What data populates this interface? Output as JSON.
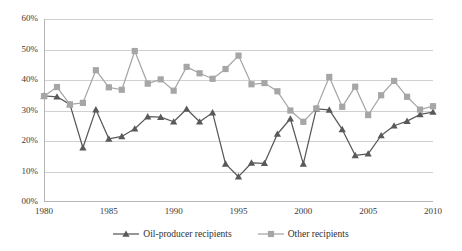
{
  "chart_data": {
    "type": "line",
    "title": "",
    "subtitle": "",
    "xlabel": "",
    "ylabel": "",
    "xlim": [
      1980,
      2010
    ],
    "ylim": [
      0,
      60
    ],
    "grid": true,
    "legend_position": "bottom-center",
    "x": [
      1980,
      1981,
      1982,
      1983,
      1984,
      1985,
      1986,
      1987,
      1988,
      1989,
      1990,
      1991,
      1992,
      1993,
      1994,
      1995,
      1996,
      1997,
      1998,
      1999,
      2000,
      2001,
      2002,
      2003,
      2004,
      2005,
      2006,
      2007,
      2008,
      2009,
      2010
    ],
    "x_tick_labels": [
      "1980",
      "1985",
      "1990",
      "1995",
      "2000",
      "2005",
      "2010"
    ],
    "x_tick_values": [
      1980,
      1985,
      1990,
      1995,
      2000,
      2005,
      2010
    ],
    "y_tick_labels": [
      "00%",
      "10%",
      "20%",
      "30%",
      "40%",
      "50%",
      "60%"
    ],
    "y_tick_values": [
      0,
      10,
      20,
      30,
      40,
      50,
      60
    ],
    "series": [
      {
        "name": "Oil-producer recipients",
        "color": "#595959",
        "marker": "triangle",
        "values": [
          34.8,
          34.5,
          32.0,
          17.8,
          30.3,
          20.7,
          21.5,
          24.0,
          28.0,
          27.8,
          26.3,
          30.5,
          26.3,
          29.3,
          12.5,
          8.3,
          12.8,
          12.7,
          22.3,
          27.3,
          12.5,
          30.5,
          30.2,
          23.8,
          15.3,
          15.8,
          21.8,
          25.0,
          26.5,
          28.7,
          29.5
        ]
      },
      {
        "name": "Other recipients",
        "color": "#a6a6a6",
        "marker": "square",
        "values": [
          34.7,
          37.7,
          32.0,
          32.5,
          43.2,
          37.6,
          36.8,
          49.5,
          38.8,
          40.2,
          36.5,
          44.3,
          42.2,
          40.4,
          43.6,
          48.0,
          38.6,
          39.0,
          36.3,
          30.0,
          26.3,
          30.7,
          41.0,
          31.2,
          37.8,
          28.5,
          35.0,
          39.7,
          34.5,
          30.3,
          31.4
        ]
      }
    ]
  },
  "legend": {
    "items": [
      {
        "label": "Oil-producer recipients",
        "color": "#595959",
        "marker": "triangle"
      },
      {
        "label": "Other recipients",
        "color": "#a6a6a6",
        "marker": "square"
      }
    ]
  },
  "colors": {
    "series_dark": "#595959",
    "series_light": "#a6a6a6",
    "gridline": "#d0d0d0",
    "axis": "#b5b5b5",
    "text": "#333333",
    "background": "#ffffff"
  }
}
